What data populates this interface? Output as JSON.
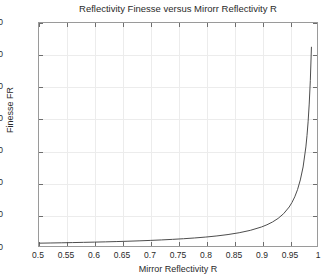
{
  "chart_data": {
    "type": "line",
    "title": "Reflectivity Finesse versus Mirorr Reflectivity R",
    "xlabel": "Mirror Reflectivity R",
    "ylabel": "Finesse FR",
    "xlim": [
      0.5,
      1.0
    ],
    "ylim": [
      0,
      350
    ],
    "grid": true,
    "legend": null,
    "xticks": [
      0.5,
      0.55,
      0.6,
      0.65,
      0.7,
      0.75,
      0.8,
      0.85,
      0.9,
      0.95,
      1
    ],
    "xticklabels": [
      "0.5",
      "0.55",
      "0.6",
      "0.65",
      "0.7",
      "0.75",
      "0.8",
      "0.85",
      "0.9",
      "0.95",
      "1"
    ],
    "yticks": [
      0,
      50,
      100,
      150,
      200,
      250,
      300,
      350
    ],
    "yticklabels": [
      "0",
      "50",
      "100",
      "150",
      "200",
      "250",
      "300",
      "350"
    ],
    "line_color": "#4d4d4d",
    "line_width": 1,
    "series": [
      {
        "name": "Finesse FR",
        "formula": "FR = pi*sqrt(R)/(1-R)",
        "x": [
          0.5,
          0.52,
          0.54,
          0.56,
          0.58,
          0.6,
          0.62,
          0.64,
          0.66,
          0.68,
          0.7,
          0.72,
          0.74,
          0.76,
          0.78,
          0.8,
          0.82,
          0.84,
          0.86,
          0.88,
          0.9,
          0.91,
          0.92,
          0.93,
          0.94,
          0.95,
          0.955,
          0.96,
          0.965,
          0.97,
          0.975,
          0.98,
          0.982,
          0.984,
          0.986,
          0.988,
          0.99
        ],
        "y": [
          4.44,
          4.72,
          5.02,
          5.35,
          5.73,
          6.08,
          6.51,
          6.98,
          7.49,
          8.09,
          8.76,
          9.53,
          10.42,
          11.41,
          12.61,
          14.05,
          15.81,
          18.0,
          20.81,
          24.55,
          29.81,
          33.31,
          37.68,
          43.28,
          50.75,
          61.22,
          68.32,
          77.17,
          88.52,
          103.66,
          124.06,
          155.47,
          173.13,
          194.85,
          222.76,
          259.47,
          312.62
        ]
      }
    ],
    "curve_max_value": 312.6,
    "curve_start_value": 4.44
  },
  "figure": {
    "background_color": "#ffffff",
    "axes_color": "#9a9a9a",
    "grid_color": "#ececec",
    "text_color": "#2a2a2a"
  }
}
